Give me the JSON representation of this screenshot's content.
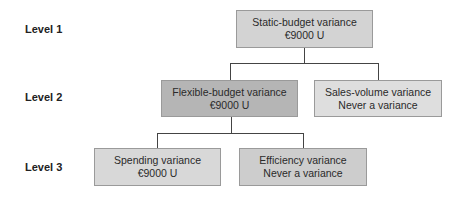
{
  "levels": [
    {
      "label": "Level 1"
    },
    {
      "label": "Level 2"
    },
    {
      "label": "Level 3"
    }
  ],
  "nodes": {
    "static_budget": {
      "title": "Static-budget variance",
      "value": "€9000 U",
      "color": "#d3d3d3"
    },
    "flexible_budget": {
      "title": "Flexible-budget variance",
      "value": "€9000 U",
      "color": "#b5b5b5"
    },
    "sales_volume": {
      "title": "Sales-volume variance",
      "value": "Never a variance",
      "color": "#dedede"
    },
    "spending": {
      "title": "Spending variance",
      "value": "€9000 U",
      "color": "#d8d8d8"
    },
    "efficiency": {
      "title": "Efficiency variance",
      "value": "Never a variance",
      "color": "#cdcdcd"
    }
  },
  "edges": [
    {
      "from": "static_budget",
      "to": "flexible_budget"
    },
    {
      "from": "static_budget",
      "to": "sales_volume"
    },
    {
      "from": "flexible_budget",
      "to": "spending"
    },
    {
      "from": "flexible_budget",
      "to": "efficiency"
    }
  ]
}
